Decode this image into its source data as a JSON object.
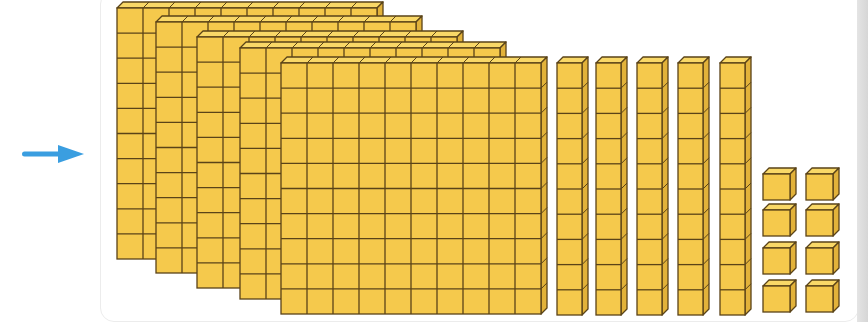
{
  "figure": {
    "arrow": {
      "direction": "right",
      "color": "#3a9ee0"
    },
    "colors": {
      "block_fill": "#f5c94c",
      "block_top": "#f9d867",
      "block_side": "#e2b23a",
      "block_stroke": "#5a4318"
    },
    "flats": {
      "count": 5,
      "grid": [
        10,
        10
      ]
    },
    "rods": {
      "count": 5,
      "cubes_per_rod": 10
    },
    "units": {
      "count": 8,
      "columns": 2,
      "rows": 4
    },
    "represented_value": 558
  }
}
